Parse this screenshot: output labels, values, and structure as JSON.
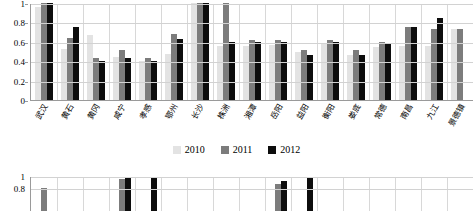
{
  "chart_data": [
    {
      "type": "bar",
      "title": "",
      "xlabel": "",
      "ylabel": "",
      "ylim": [
        0,
        1
      ],
      "yticks": [
        "0",
        "0.2",
        "0.4",
        "0.6",
        "0.8",
        "1"
      ],
      "grid": true,
      "legend_position": "bottom",
      "categories": [
        "武汉",
        "黄石",
        "黄冈",
        "咸宁",
        "孝感",
        "鄂州",
        "长沙",
        "株洲",
        "湘潭",
        "岳阳",
        "益阳",
        "衡阳",
        "娄底",
        "常德",
        "南昌",
        "九江",
        "景德镇"
      ],
      "series": [
        {
          "name": "2010",
          "color": "#e3e3e3",
          "values": [
            0.96,
            0.53,
            0.67,
            0.44,
            0.4,
            0.47,
            1.0,
            0.56,
            0.56,
            0.57,
            0.5,
            0.58,
            0.46,
            0.55,
            0.56,
            0.56,
            0.73
          ]
        },
        {
          "name": "2011",
          "color": "#7c7c7c",
          "values": [
            1.0,
            0.64,
            0.43,
            0.52,
            0.43,
            0.68,
            1.0,
            1.0,
            0.62,
            0.62,
            0.52,
            0.62,
            0.52,
            0.6,
            0.75,
            0.73,
            0.73
          ]
        },
        {
          "name": "2012",
          "color": "#0d0d0d",
          "values": [
            1.0,
            0.75,
            0.4,
            0.43,
            0.4,
            0.63,
            1.0,
            0.6,
            0.6,
            0.6,
            0.46,
            0.6,
            0.46,
            0.58,
            0.75,
            0.85,
            0.0
          ]
        }
      ]
    },
    {
      "type": "bar",
      "title": "",
      "clipped": true,
      "ylim": [
        0,
        1
      ],
      "yticks": [
        "1",
        "0.8"
      ],
      "grid": true,
      "categories": [
        "c1",
        "c2",
        "c3",
        "c4",
        "c5",
        "c6",
        "c7",
        "c8",
        "c9",
        "c10",
        "c11",
        "c12",
        "c13",
        "c14",
        "c15",
        "c16",
        "c17"
      ],
      "series": [
        {
          "name": "2010",
          "color": "#e3e3e3",
          "values": [
            0.0,
            0.0,
            0.0,
            0.0,
            0.0,
            0.0,
            0.0,
            0.0,
            0.0,
            0.0,
            0.0,
            0.0,
            0.0,
            0.0,
            0.0,
            0.0,
            0.0
          ]
        },
        {
          "name": "2011",
          "color": "#7c7c7c",
          "values": [
            0.82,
            0.0,
            0.0,
            0.97,
            0.0,
            0.0,
            0.0,
            0.0,
            0.0,
            0.88,
            0.0,
            0.0,
            0.0,
            0.0,
            0.0,
            0.0,
            0.0
          ]
        },
        {
          "name": "2012",
          "color": "#0d0d0d",
          "values": [
            0.0,
            0.0,
            0.0,
            1.0,
            1.0,
            0.0,
            0.0,
            0.0,
            0.0,
            0.94,
            1.0,
            0.0,
            0.0,
            0.0,
            0.0,
            0.0,
            0.0
          ]
        }
      ]
    }
  ],
  "legend": {
    "items": [
      {
        "label": "2010",
        "color": "#e3e3e3"
      },
      {
        "label": "2011",
        "color": "#7c7c7c"
      },
      {
        "label": "2012",
        "color": "#0d0d0d"
      }
    ]
  }
}
